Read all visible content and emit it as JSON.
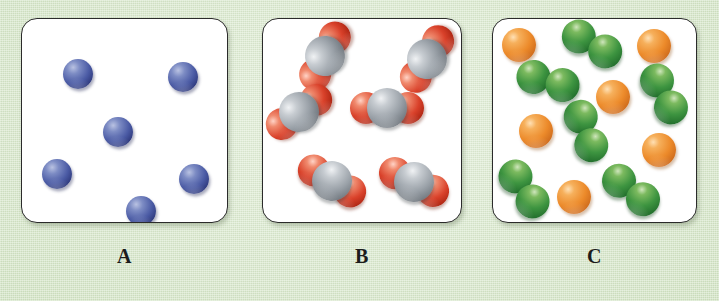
{
  "figure": {
    "background_color": "#dcebd0",
    "panel_background": "#ffffff",
    "panel_border_color": "#2b2b2b",
    "width": 719,
    "height": 301
  },
  "palette": {
    "blue": "#4a5aa4",
    "red": "#d9412a",
    "gray": "#9aa1a8",
    "green": "#3d9440",
    "orange": "#ec8a2a"
  },
  "panels": [
    {
      "id": "A",
      "label": "A",
      "box": {
        "left": 21,
        "top": 18,
        "width": 207,
        "height": 205
      },
      "label_box": {
        "left": 21,
        "top": 245,
        "width": 207
      },
      "species": [
        {
          "name": "blue-atom",
          "count": 6,
          "type": "monatomic",
          "colors": [
            "blue"
          ]
        }
      ],
      "atom_radius": 15,
      "items": [
        {
          "kind": "atom",
          "color": "blue",
          "x": 56,
          "y": 55,
          "r": 15
        },
        {
          "kind": "atom",
          "color": "blue",
          "x": 161,
          "y": 58,
          "r": 15
        },
        {
          "kind": "atom",
          "color": "blue",
          "x": 96,
          "y": 113,
          "r": 15
        },
        {
          "kind": "atom",
          "color": "blue",
          "x": 35,
          "y": 155,
          "r": 15
        },
        {
          "kind": "atom",
          "color": "blue",
          "x": 172,
          "y": 160,
          "r": 15
        },
        {
          "kind": "atom",
          "color": "blue",
          "x": 119,
          "y": 192,
          "r": 15
        }
      ]
    },
    {
      "id": "B",
      "label": "B",
      "box": {
        "left": 262,
        "top": 18,
        "width": 200,
        "height": 205
      },
      "label_box": {
        "left": 262,
        "top": 245,
        "width": 200
      },
      "species": [
        {
          "name": "triatomic-molecule",
          "count": 6,
          "type": "triatomic",
          "colors": [
            "red",
            "gray",
            "red"
          ]
        }
      ],
      "items": [
        {
          "kind": "triatomic",
          "x": 62,
          "y": 37,
          "rot": -62,
          "center_r": 20,
          "end_r": 16,
          "offset": 21
        },
        {
          "kind": "triatomic",
          "x": 164,
          "y": 40,
          "rot": -58,
          "center_r": 20,
          "end_r": 16,
          "offset": 21
        },
        {
          "kind": "triatomic",
          "x": 36,
          "y": 93,
          "rot": -35,
          "center_r": 20,
          "end_r": 16,
          "offset": 21
        },
        {
          "kind": "triatomic",
          "x": 124,
          "y": 89,
          "rot": 0,
          "center_r": 20,
          "end_r": 16,
          "offset": 21
        },
        {
          "kind": "triatomic",
          "x": 69,
          "y": 162,
          "rot": 30,
          "center_r": 20,
          "end_r": 16,
          "offset": 21
        },
        {
          "kind": "triatomic",
          "x": 151,
          "y": 163,
          "rot": 25,
          "center_r": 20,
          "end_r": 16,
          "offset": 21
        }
      ]
    },
    {
      "id": "C",
      "label": "C",
      "box": {
        "left": 492,
        "top": 18,
        "width": 205,
        "height": 205
      },
      "label_box": {
        "left": 492,
        "top": 245,
        "width": 205
      },
      "species": [
        {
          "name": "orange-atom",
          "count": 6,
          "type": "monatomic",
          "colors": [
            "orange"
          ]
        },
        {
          "name": "green-diatomic-molecule",
          "count": 6,
          "type": "diatomic",
          "colors": [
            "green",
            "green"
          ]
        }
      ],
      "items": [
        {
          "kind": "atom",
          "color": "orange",
          "x": 26,
          "y": 26,
          "r": 17
        },
        {
          "kind": "diatomic",
          "color": "green",
          "x": 99,
          "y": 25,
          "rot": 22,
          "r": 17,
          "offset": 15
        },
        {
          "kind": "atom",
          "color": "orange",
          "x": 161,
          "y": 27,
          "r": 17
        },
        {
          "kind": "diatomic",
          "color": "green",
          "x": 55,
          "y": 62,
          "rot": 8,
          "r": 17,
          "offset": 15
        },
        {
          "kind": "atom",
          "color": "orange",
          "x": 120,
          "y": 78,
          "r": 17
        },
        {
          "kind": "diatomic",
          "color": "green",
          "x": 171,
          "y": 75,
          "rot": 55,
          "r": 17,
          "offset": 15
        },
        {
          "kind": "atom",
          "color": "orange",
          "x": 43,
          "y": 112,
          "r": 17
        },
        {
          "kind": "diatomic",
          "color": "green",
          "x": 93,
          "y": 112,
          "rot": 62,
          "r": 17,
          "offset": 15
        },
        {
          "kind": "atom",
          "color": "orange",
          "x": 166,
          "y": 131,
          "r": 17
        },
        {
          "kind": "diatomic",
          "color": "green",
          "x": 31,
          "y": 170,
          "rot": 48,
          "r": 17,
          "offset": 15
        },
        {
          "kind": "atom",
          "color": "orange",
          "x": 81,
          "y": 178,
          "r": 17
        },
        {
          "kind": "diatomic",
          "color": "green",
          "x": 138,
          "y": 171,
          "rot": 30,
          "r": 17,
          "offset": 15
        }
      ]
    }
  ]
}
